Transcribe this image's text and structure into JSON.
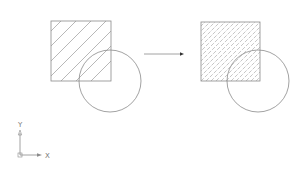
{
  "diagram": {
    "colors": {
      "line": "#8a8a8a",
      "hatch": "#9a9a9a",
      "background": "#ffffff"
    },
    "before": {
      "square": {
        "x": 51,
        "y": 21,
        "size": 60
      },
      "circle": {
        "cx": 110,
        "cy": 81,
        "r": 31
      },
      "hatch": "ANSI31 diagonal, wide spacing"
    },
    "arrow": {
      "x1": 144,
      "y1": 54,
      "x2": 183,
      "y2": 54
    },
    "after": {
      "square": {
        "x": 201,
        "y": 22,
        "size": 59
      },
      "circle": {
        "cx": 258,
        "cy": 81,
        "r": 31
      },
      "hatch": "dense dashed diagonal"
    },
    "ucs_icon": {
      "x_label": "X",
      "y_label": "Y",
      "origin": {
        "x": 20,
        "y": 155
      }
    }
  }
}
